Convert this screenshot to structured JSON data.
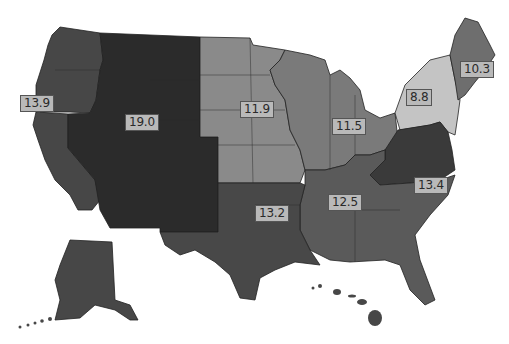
{
  "map": {
    "type": "choropleth",
    "area": "United States",
    "regions": [
      {
        "id": "region-10",
        "name": "Northwest (WA, OR, ID, AK)",
        "value": "13.9",
        "color": "#474747"
      },
      {
        "id": "region-8-9",
        "name": "West/Mountain (MT, WY, NV, UT, CO, AZ, NM)",
        "value": "19.0",
        "color": "#2b2b2b"
      },
      {
        "id": "region-midwest-plains",
        "name": "Plains (ND, SD, NE, KS, MN, IA, MO)",
        "value": "11.9",
        "color": "#8a8a8a"
      },
      {
        "id": "region-great-lakes",
        "name": "Great Lakes (WI, MI, IL, IN, OH)",
        "value": "11.5",
        "color": "#7a7a7a"
      },
      {
        "id": "region-ny-nj",
        "name": "NY, NJ",
        "value": "8.8",
        "color": "#c4c4c4"
      },
      {
        "id": "region-new-england",
        "name": "New England",
        "value": "10.3",
        "color": "#6e6e6e"
      },
      {
        "id": "region-mid-atlantic",
        "name": "Mid-Atlantic (PA, WV, VA, MD, DE)",
        "value": "13.4",
        "color": "#3a3a3a"
      },
      {
        "id": "region-southeast",
        "name": "Southeast (KY, TN, MS, AL, GA, FL, SC, NC)",
        "value": "12.5",
        "color": "#5a5a5a"
      },
      {
        "id": "region-south-central",
        "name": "South Central (TX, OK, AR, LA)",
        "value": "13.2",
        "color": "#484848"
      }
    ],
    "labels": [
      {
        "text": "13.9",
        "x": 20,
        "y": 97
      },
      {
        "text": "19.0",
        "x": 125,
        "y": 116
      },
      {
        "text": "11.9",
        "x": 240,
        "y": 103
      },
      {
        "text": "11.5",
        "x": 332,
        "y": 120
      },
      {
        "text": "8.8",
        "x": 406,
        "y": 89
      },
      {
        "text": "10.3",
        "x": 460,
        "y": 61
      },
      {
        "text": "13.4",
        "x": 414,
        "y": 177
      },
      {
        "text": "12.5",
        "x": 328,
        "y": 196
      },
      {
        "text": "13.2",
        "x": 255,
        "y": 206
      }
    ]
  }
}
